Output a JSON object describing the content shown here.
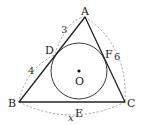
{
  "diagram": {
    "points": {
      "A": {
        "label": "A",
        "x": 85,
        "y": 17
      },
      "B": {
        "label": "B",
        "x": 19,
        "y": 102
      },
      "C": {
        "label": "C",
        "x": 125,
        "y": 102
      },
      "D": {
        "label": "D",
        "x": 54,
        "y": 55
      },
      "E": {
        "label": "E",
        "x": 78,
        "y": 102
      },
      "F": {
        "label": "F",
        "x": 104,
        "y": 54
      },
      "O": {
        "label": "O",
        "x": 79,
        "y": 71
      }
    },
    "incircle": {
      "center": "O",
      "radius": 28
    },
    "segment_labels": {
      "AD": "3",
      "BD": "4",
      "AC": "6",
      "BC": "x"
    },
    "colors": {
      "stroke": "#222222",
      "dashed": "#888888",
      "background": "#ffffff"
    }
  }
}
